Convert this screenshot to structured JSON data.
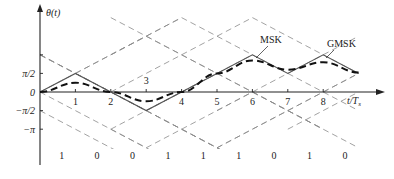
{
  "axes": {
    "y_label": "θ(t)",
    "x_label": "t/T",
    "x_label_sub": "s",
    "y_ticks": [
      {
        "label": "π/2",
        "value": 1
      },
      {
        "label": "0",
        "value": 0
      },
      {
        "label": "−π/2",
        "value": -1
      },
      {
        "label": "−π",
        "value": -2
      }
    ],
    "x_ticks": [
      "1",
      "2",
      "3",
      "4",
      "5",
      "6",
      "7",
      "8"
    ]
  },
  "legend": {
    "msk": "MSK",
    "gmsk": "GMSK"
  },
  "bits": [
    "1",
    "0",
    "0",
    "1",
    "1",
    "1",
    "0",
    "1",
    "0"
  ],
  "chart_data": {
    "type": "line",
    "title": "",
    "xlabel": "t/Ts",
    "ylabel": "θ(t)",
    "x": [
      0,
      1,
      2,
      3,
      4,
      5,
      6,
      7,
      8,
      9
    ],
    "series": [
      {
        "name": "MSK",
        "unit": "π/2",
        "values": [
          0,
          1,
          0,
          -1,
          0,
          1,
          2,
          1,
          2,
          1
        ]
      },
      {
        "name": "GMSK",
        "unit": "π/2",
        "values": [
          0,
          0.5,
          0,
          -0.5,
          0,
          1,
          1.7,
          1.2,
          1.6,
          1.05
        ]
      }
    ],
    "data_bits": [
      1,
      0,
      0,
      1,
      1,
      1,
      0,
      1,
      0
    ],
    "ylim_units_pi_over_2": [
      -2,
      4
    ],
    "xlim": [
      0,
      9.8
    ],
    "grid": "dashed phase trellis"
  },
  "colors": {
    "axis": "#222222",
    "trellis": "#8a8a8a",
    "msk": "#555555",
    "gmsk": "#111111"
  }
}
